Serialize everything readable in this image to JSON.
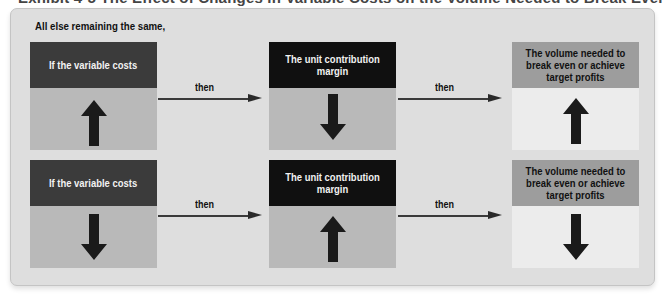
{
  "figure": {
    "cut_title": "Exhibit 4-5 The Effect of Changes in Variable Costs on the Volume Needed to Break Even or Achieve Target Profits",
    "intro": "All else remaining the same,",
    "colors": {
      "panel": "#dedede",
      "header_dark": "#3b3b3b",
      "header_black": "#101010",
      "header_gray": "#9d9d9d",
      "body_gray": "#b9b9b9",
      "body_light": "#ececec",
      "arrow": "#1a1a1a"
    },
    "connector_label": "then",
    "rows": [
      {
        "cause": {
          "label": "If the variable costs",
          "direction": "up",
          "icon": "arrow-up-icon"
        },
        "effect": {
          "label": "The unit contribution margin",
          "direction": "down",
          "icon": "arrow-down-icon"
        },
        "result": {
          "label": "The volume needed to break even or achieve target profits",
          "direction": "up",
          "icon": "arrow-up-icon"
        },
        "connector_1": "then",
        "connector_2": "then"
      },
      {
        "cause": {
          "label": "If the variable costs",
          "direction": "down",
          "icon": "arrow-down-icon"
        },
        "effect": {
          "label": "The unit contribution margin",
          "direction": "up",
          "icon": "arrow-up-icon"
        },
        "result": {
          "label": "The volume needed to break even or achieve target profits",
          "direction": "down",
          "icon": "arrow-down-icon"
        },
        "connector_1": "then",
        "connector_2": "then"
      }
    ]
  }
}
